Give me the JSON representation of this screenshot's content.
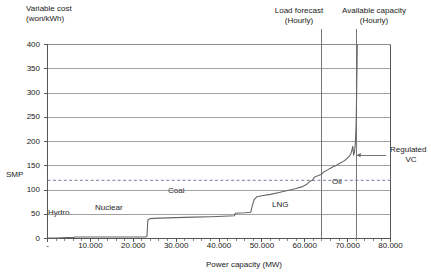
{
  "chart_data": {
    "type": "line",
    "title": "",
    "ylabel_line1": "Variable cost",
    "ylabel_line2": "(won/kWh)",
    "xlabel": "Power capacity (MW)",
    "xlim": [
      0,
      80000
    ],
    "ylim": [
      0,
      400
    ],
    "grid": true,
    "legend_position": "inline-annotations",
    "yticks": [
      "400",
      "350",
      "300",
      "250",
      "200",
      "150",
      "100",
      "50",
      "0"
    ],
    "ytick_values": [
      400,
      350,
      300,
      250,
      200,
      150,
      100,
      50,
      0
    ],
    "xticks": [
      "-",
      "10.000",
      "20.000",
      "30.000",
      "40.000",
      "50.000",
      "60.000",
      "70.000",
      "80.000"
    ],
    "xtick_values": [
      0,
      10000,
      20000,
      30000,
      40000,
      50000,
      60000,
      70000,
      80000
    ],
    "series": [
      {
        "name": "Merit order supply curve (Regulated VC)",
        "points": [
          [
            0,
            1
          ],
          [
            2000,
            1
          ],
          [
            4500,
            2
          ],
          [
            6200,
            2
          ],
          [
            6400,
            3
          ],
          [
            9000,
            3
          ],
          [
            12000,
            3
          ],
          [
            16000,
            3
          ],
          [
            20000,
            3
          ],
          [
            22800,
            3
          ],
          [
            23200,
            4
          ],
          [
            23400,
            38
          ],
          [
            23900,
            41
          ],
          [
            26000,
            42
          ],
          [
            30000,
            43
          ],
          [
            34000,
            44
          ],
          [
            38000,
            45
          ],
          [
            41000,
            46
          ],
          [
            43600,
            47
          ],
          [
            43800,
            52
          ],
          [
            46000,
            53
          ],
          [
            47400,
            54
          ],
          [
            47600,
            62
          ],
          [
            48200,
            80
          ],
          [
            48800,
            86
          ],
          [
            50000,
            88
          ],
          [
            52000,
            91
          ],
          [
            54000,
            95
          ],
          [
            56000,
            99
          ],
          [
            58000,
            103
          ],
          [
            59500,
            107
          ],
          [
            60500,
            112
          ],
          [
            61200,
            118
          ],
          [
            61800,
            120
          ],
          [
            62200,
            126
          ],
          [
            62600,
            128
          ],
          [
            63200,
            130
          ],
          [
            63800,
            132
          ],
          [
            64400,
            137
          ],
          [
            64900,
            139
          ],
          [
            65400,
            142
          ],
          [
            66000,
            145
          ],
          [
            66600,
            148
          ],
          [
            67200,
            150
          ],
          [
            67800,
            153
          ],
          [
            68400,
            156
          ],
          [
            69000,
            159
          ],
          [
            69600,
            163
          ],
          [
            70100,
            167
          ],
          [
            70500,
            171
          ],
          [
            70800,
            176
          ],
          [
            71000,
            182
          ],
          [
            71200,
            190
          ],
          [
            71400,
            172
          ],
          [
            71600,
            178
          ],
          [
            71800,
            196
          ],
          [
            72000,
            240
          ],
          [
            72100,
            300
          ],
          [
            72200,
            360
          ],
          [
            72250,
            400
          ]
        ]
      },
      {
        "name": "SMP",
        "type": "dashed-horizontal",
        "value": 120
      }
    ],
    "vlines": [
      {
        "name": "Load forecast (Hourly)",
        "label_line1": "Load forecast",
        "label_line2": "(Hourly)",
        "x": 64000
      },
      {
        "name": "Available capacity (Hourly)",
        "label_line1": "Available capacity",
        "label_line2": "(Hourly)",
        "x": 72000
      }
    ],
    "annotations": [
      {
        "name": "hydro",
        "text": "Hydro",
        "x": 4000,
        "y": 18
      },
      {
        "name": "nuclear",
        "text": "Nuclear",
        "x": 15000,
        "y": 26
      },
      {
        "name": "coal",
        "text": "Coal",
        "x": 32000,
        "y": 55
      },
      {
        "name": "lng",
        "text": "LNG",
        "x": 54000,
        "y": 30
      },
      {
        "name": "oil",
        "text": "Oil",
        "x": 68000,
        "y": 100
      },
      {
        "name": "regulated-vc",
        "text_line1": "Regulated",
        "text_line2": "VC",
        "x": 77000,
        "y": 172
      }
    ],
    "smp_label": "SMP"
  },
  "colors": {
    "axis": "#555555",
    "grid": "#888888",
    "curve": "#666666",
    "smp_line": "#7a7a9a",
    "vline": "#777777",
    "text": "#1a1a1a",
    "background": "#ffffff"
  }
}
